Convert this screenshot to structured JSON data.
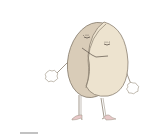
{
  "image": {
    "description": "Cartoon illustration of a split round pill/tablet character with closed sleepy eyes, stick arms with white gloves, and thin legs wearing pink high-heel shoes",
    "colors": {
      "background": "#ffffff",
      "pill_back": "#d9ccb8",
      "pill_front": "#ede3cf",
      "outline": "#8a7f70",
      "glove": "#ffffff",
      "shoe": "#e8c8c8",
      "shadow_line": "#9a9a9a"
    }
  }
}
